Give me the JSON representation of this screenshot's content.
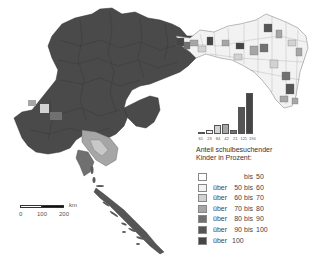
{
  "map": {
    "colors": {
      "bis_50": "#ffffff",
      "50_60": "#f2f2f2",
      "60_70": "#d2d2d2",
      "70_80": "#a6a6a6",
      "80_90": "#707070",
      "90_100": "#555555",
      "ueber_100": "#454545",
      "boundary": "#333333"
    }
  },
  "chart_data": {
    "type": "bar",
    "title": "",
    "categories": [
      "bis 50",
      "über 50 bis 60",
      "über 60 bis 70",
      "über 70 bis 80",
      "über 80 bis 90",
      "über 90 bis 100",
      "über 100"
    ],
    "values": [
      61,
      23,
      84,
      42,
      21,
      121,
      190
    ],
    "labels": [
      "61",
      "23",
      "84",
      "42",
      "21",
      "121",
      "190"
    ],
    "xlabel": "",
    "ylabel": ""
  },
  "histogram": {
    "bars": [
      {
        "label": "61",
        "height": 2,
        "color": "#ffffff"
      },
      {
        "label": "23",
        "height": 4,
        "color": "#f2f2f2"
      },
      {
        "label": "84",
        "height": 9,
        "color": "#d2d2d2"
      },
      {
        "label": "42",
        "height": 10,
        "color": "#a6a6a6"
      },
      {
        "label": "21",
        "height": 4,
        "color": "#707070"
      },
      {
        "label": "121",
        "height": 27,
        "color": "#555555"
      },
      {
        "label": "190",
        "height": 41,
        "color": "#454545"
      }
    ]
  },
  "legend": {
    "title_line1": "Anteil schulbesuchender",
    "title_line2": "Kinder in Prozent:",
    "items": [
      {
        "over": "",
        "from": "",
        "bis": "bis",
        "to": "50",
        "color": "#ffffff"
      },
      {
        "over": "über",
        "from": "50",
        "bis": "bis",
        "to": "60",
        "color": "#f2f2f2"
      },
      {
        "over": "über",
        "from": "60",
        "bis": "bis",
        "to": "70",
        "color": "#d2d2d2"
      },
      {
        "over": "über",
        "from": "70",
        "bis": "bis",
        "to": "80",
        "color": "#a6a6a6"
      },
      {
        "over": "über",
        "from": "80",
        "bis": "bis",
        "to": "90",
        "color": "#707070"
      },
      {
        "over": "über",
        "from": "90",
        "bis": "bis",
        "to": "100",
        "color": "#555555"
      },
      {
        "over": "über",
        "from": "100",
        "bis": "",
        "to": "",
        "color": "#454545"
      }
    ]
  },
  "scale_bar": {
    "ticks": [
      "0",
      "100",
      "200"
    ],
    "unit": "km"
  }
}
